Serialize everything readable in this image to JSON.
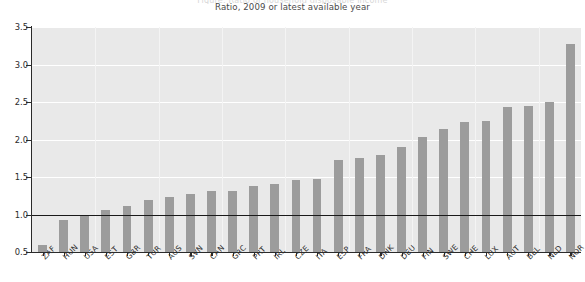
{
  "figure": {
    "clipped_title": "Figure: Ratio of household disposable income",
    "subtitle": "Ratio, 2009 or latest available year",
    "source_note": ""
  },
  "colors": {
    "bar": "#9c9c9c",
    "plot_background": "#e9e9e9",
    "gridline": "#ffffff",
    "axis": "#2b2b2b",
    "reference_line": "#1a1a1a"
  },
  "chart_data": {
    "type": "bar",
    "title": "Ratio, 2009 or latest available year",
    "subtitle": "Ratio, 2009 or latest available year",
    "xlabel": "",
    "ylabel": "",
    "ylim": [
      0.5,
      3.5
    ],
    "yticks": [
      0.5,
      1.0,
      1.5,
      2.0,
      2.5,
      3.0,
      3.5
    ],
    "ytick_labels": [
      "0.5",
      "1.0",
      "1.5",
      "2.0",
      "2.5",
      "3.0",
      "3.5"
    ],
    "grid": true,
    "legend": null,
    "reference_line": 1.0,
    "categories": [
      "ZAF",
      "HUN",
      "USA",
      "EST",
      "GBR",
      "TUR",
      "AUS",
      "SVN",
      "CAN",
      "GRC",
      "PRT",
      "IRL",
      "CZE",
      "ITA",
      "ESP",
      "FRA",
      "DNK",
      "DEU",
      "FIN",
      "SWE",
      "CHE",
      "LUX",
      "AUT",
      "BEL",
      "NLD",
      "NOR"
    ],
    "values": [
      0.6,
      0.93,
      1.0,
      1.06,
      1.11,
      1.2,
      1.24,
      1.27,
      1.31,
      1.32,
      1.38,
      1.41,
      1.46,
      1.48,
      1.73,
      1.76,
      1.8,
      1.9,
      2.03,
      2.14,
      2.23,
      2.25,
      2.43,
      2.45,
      2.5,
      3.27
    ],
    "series": [
      {
        "name": "Ratio",
        "values": [
          0.6,
          0.93,
          1.0,
          1.06,
          1.11,
          1.2,
          1.24,
          1.27,
          1.31,
          1.32,
          1.38,
          1.41,
          1.46,
          1.48,
          1.73,
          1.76,
          1.8,
          1.9,
          2.03,
          2.14,
          2.23,
          2.25,
          2.43,
          2.45,
          2.5,
          3.27
        ]
      }
    ]
  }
}
